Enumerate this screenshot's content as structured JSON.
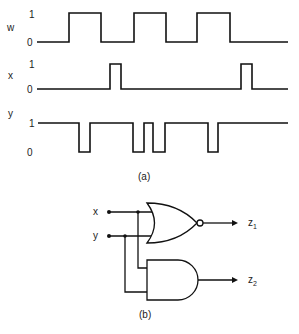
{
  "figure": {
    "part_a": {
      "caption": "(a)",
      "signals": [
        {
          "name": "w",
          "high_label": "1",
          "low_label": "0",
          "initial": 0,
          "transitions": [
            69,
            101,
            134,
            166,
            197,
            230
          ],
          "x_start": 37,
          "x_end": 288
        },
        {
          "name": "x",
          "high_label": "1",
          "low_label": "0",
          "initial": 0,
          "transitions": [
            110,
            121,
            241,
            252
          ],
          "x_start": 37,
          "x_end": 288
        },
        {
          "name": "y",
          "high_label": "1",
          "low_label": "0",
          "initial": 1,
          "transitions": [
            79,
            90,
            133,
            144,
            153,
            165,
            208,
            218
          ],
          "x_start": 38,
          "x_end": 288
        }
      ]
    },
    "part_b": {
      "caption": "(b)",
      "inputs": [
        "x",
        "y"
      ],
      "gates": [
        {
          "type": "NOR",
          "output": "z",
          "output_sub": "1"
        },
        {
          "type": "AND",
          "output": "z",
          "output_sub": "2"
        }
      ]
    }
  }
}
